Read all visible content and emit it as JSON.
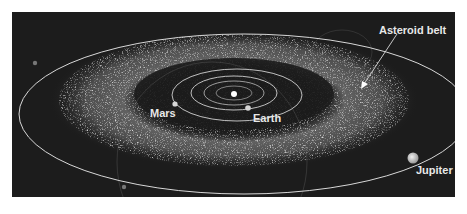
{
  "diagram": {
    "labels": {
      "asteroid_belt": "Asteroid belt",
      "mars": "Mars",
      "earth": "Earth",
      "jupiter": "Jupiter"
    },
    "colors": {
      "background": "#1c1c1c",
      "orbit": "#d8d8d8",
      "belt": "#bdbdbd",
      "sun": "#ffffff",
      "jupiter": "#cfcfcf"
    }
  }
}
